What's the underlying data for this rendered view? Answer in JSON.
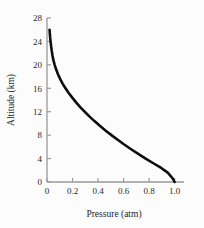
{
  "chart_data": {
    "type": "line",
    "title": "",
    "subtitle": "",
    "xlabel": "Pressure (atm)",
    "ylabel": "Altitude (km)",
    "xlim": [
      0,
      1.05
    ],
    "ylim": [
      0,
      28
    ],
    "grid": false,
    "legend": null,
    "xticks": [
      0,
      0.2,
      0.4,
      0.6,
      0.8,
      1.0
    ],
    "xticklabels": [
      "0",
      "0.2",
      "0.4",
      "0.6",
      "0.8",
      "1.0"
    ],
    "yticks": [
      0,
      4,
      8,
      12,
      16,
      20,
      24,
      28
    ],
    "yticklabels": [
      "0",
      "4",
      "8",
      "12",
      "16",
      "20",
      "24",
      "28"
    ],
    "series": [
      {
        "name": "atmospheric pressure profile",
        "color": "#0d0d0d",
        "linewidth": 2.6,
        "x": [
          0.02,
          0.022,
          0.025,
          0.028,
          0.032,
          0.037,
          0.043,
          0.05,
          0.06,
          0.072,
          0.086,
          0.103,
          0.122,
          0.145,
          0.17,
          0.198,
          0.228,
          0.26,
          0.295,
          0.332,
          0.372,
          0.414,
          0.458,
          0.505,
          0.554,
          0.605,
          0.659,
          0.715,
          0.773,
          0.833,
          0.895,
          0.946,
          0.985,
          1.0
        ],
        "y": [
          26.0,
          25.4,
          24.6,
          24.0,
          23.2,
          22.4,
          21.6,
          20.8,
          20.0,
          19.2,
          18.4,
          17.6,
          16.8,
          16.0,
          15.2,
          14.4,
          13.6,
          12.8,
          12.0,
          11.2,
          10.4,
          9.6,
          8.8,
          8.0,
          7.2,
          6.4,
          5.6,
          4.8,
          4.0,
          3.2,
          2.4,
          1.6,
          0.6,
          0.0
        ]
      }
    ],
    "annotations": [],
    "axis_color": "#9a9a9a",
    "background": "#fcfcfc"
  },
  "figure": {
    "caption": "",
    "alt": "Altitude versus pressure curve"
  }
}
